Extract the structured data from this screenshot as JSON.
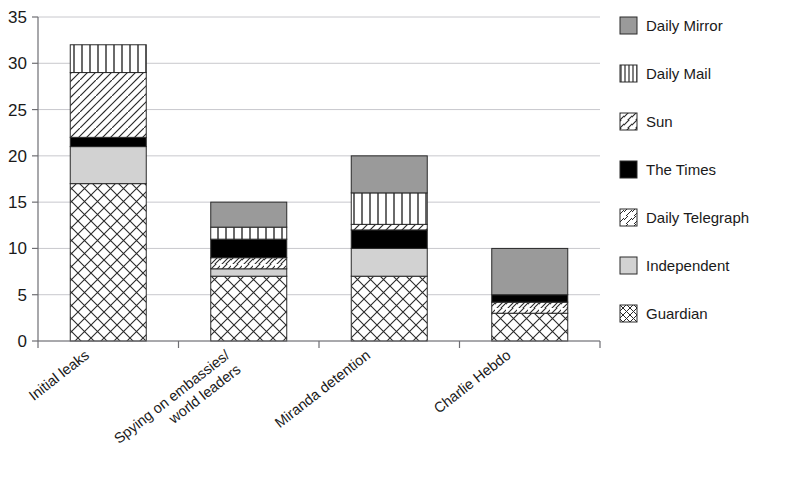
{
  "chart_data": {
    "type": "bar",
    "subtype": "stacked-bar",
    "title": "",
    "xlabel": "",
    "ylabel": "",
    "ylim": [
      0,
      35
    ],
    "ytick_step": 5,
    "yticks": [
      "0",
      "5",
      "10",
      "15",
      "20",
      "25",
      "30",
      "35"
    ],
    "grid": true,
    "grid_axis": "y",
    "legend_position": "right",
    "categories": [
      "Initial leaks",
      "Spying on embassies/ world leaders",
      "Miranda detention",
      "Charlie Hebdo"
    ],
    "category_lines": [
      [
        "Initial leaks"
      ],
      [
        "Spying on embassies/",
        "world leaders"
      ],
      [
        "Miranda detention"
      ],
      [
        "Charlie Hebdo"
      ]
    ],
    "series": [
      {
        "name": "Guardian",
        "pattern": "crosshatch",
        "color": "#ffffff",
        "values": [
          17,
          7,
          7,
          3
        ]
      },
      {
        "name": "Independent",
        "pattern": "solid-light-gray",
        "color": "#d2d2d2",
        "values": [
          4,
          0.8,
          3,
          0
        ]
      },
      {
        "name": "Daily Telegraph",
        "pattern": "diagonal",
        "color": "#ffffff",
        "values": [
          0,
          1.2,
          0,
          1.2
        ]
      },
      {
        "name": "The Times",
        "pattern": "solid-black",
        "color": "#000000",
        "values": [
          1,
          2,
          2,
          0.8
        ]
      },
      {
        "name": "Sun",
        "pattern": "steep-diagonal",
        "color": "#ffffff",
        "values": [
          7,
          0,
          0.6,
          0
        ]
      },
      {
        "name": "Daily Mail",
        "pattern": "vertical-lines",
        "color": "#ffffff",
        "values": [
          3,
          1.3,
          3.4,
          0
        ]
      },
      {
        "name": "Daily Mirror",
        "pattern": "solid-dark-gray",
        "color": "#9a9a9a",
        "values": [
          0,
          2.7,
          4,
          5
        ]
      }
    ],
    "totals": [
      33,
      15,
      20,
      10
    ],
    "stack_order_bottom_to_top": [
      "Guardian",
      "Independent",
      "Daily Telegraph",
      "The Times",
      "Sun",
      "Daily Mail",
      "Daily Mirror"
    ]
  },
  "legend": {
    "entries": [
      {
        "label": "Daily Mirror",
        "pattern": "solid-dark-gray"
      },
      {
        "label": "Daily Mail",
        "pattern": "vertical-lines"
      },
      {
        "label": "Sun",
        "pattern": "steep-diagonal"
      },
      {
        "label": "The Times",
        "pattern": "solid-black"
      },
      {
        "label": "Daily Telegraph",
        "pattern": "diagonal"
      },
      {
        "label": "Independent",
        "pattern": "solid-light-gray"
      },
      {
        "label": "Guardian",
        "pattern": "crosshatch"
      }
    ]
  },
  "colors": {
    "dark_gray": "#9a9a9a",
    "light_gray": "#d2d2d2",
    "black": "#000000",
    "white": "#ffffff",
    "gridline": "#c8c8cd",
    "axis": "#6e6e73",
    "outline": "#2a2a2a",
    "text": "#1a1a1a"
  }
}
